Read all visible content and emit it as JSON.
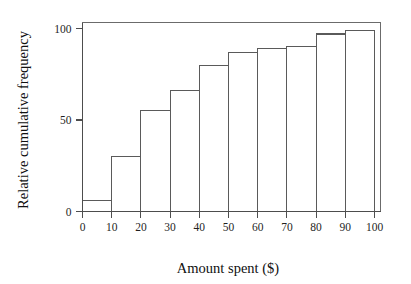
{
  "chart_data": {
    "type": "bar",
    "title": "",
    "subtitle": "",
    "xlabel": "Amount spent ($)",
    "ylabel": "Relative cumulative frequency",
    "xlim": [
      0,
      100
    ],
    "ylim": [
      0,
      105
    ],
    "grid": false,
    "legend": null,
    "legend_position": "none",
    "bin_width": 10,
    "bin_edges": [
      0,
      10,
      20,
      30,
      40,
      50,
      60,
      70,
      80,
      90,
      100
    ],
    "categories": [
      "0-10",
      "10-20",
      "20-30",
      "30-40",
      "40-50",
      "50-60",
      "60-70",
      "70-80",
      "80-90",
      "90-100"
    ],
    "values": [
      6,
      30,
      55,
      66,
      80,
      87,
      89,
      90,
      97,
      99
    ],
    "xticks": [
      0,
      10,
      20,
      30,
      40,
      50,
      60,
      70,
      80,
      90,
      100
    ],
    "xtick_labels": [
      "0",
      "10",
      "20",
      "30",
      "40",
      "50",
      "60",
      "70",
      "80",
      "90",
      "100"
    ],
    "yticks": [
      0,
      50,
      100
    ],
    "ytick_labels": [
      "0",
      "50",
      "100"
    ],
    "colors": {
      "bar_fill": "#ffffff",
      "bar_stroke": "#5a5a5a",
      "axis": "#4d4d4d",
      "frame": "#6b6b6b",
      "text": "#1f1f1f",
      "background": "#ffffff"
    }
  }
}
